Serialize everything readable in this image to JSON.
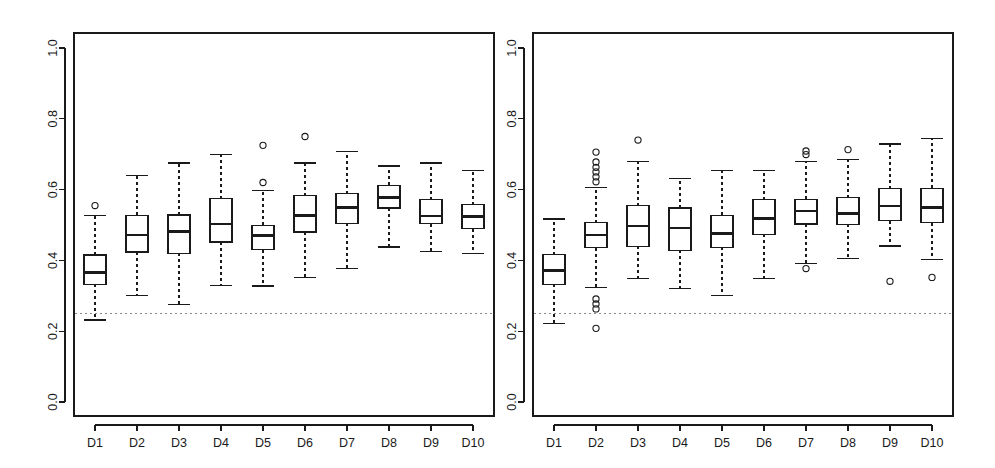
{
  "figure": {
    "width": 995,
    "height": 468,
    "background": "#ffffff",
    "panel_count": 2,
    "line_color": "#1a1a1a",
    "ref_line_color": "#8a8a8a"
  },
  "chart_data": [
    {
      "type": "box",
      "panel": "left",
      "title": "",
      "xlabel": "",
      "ylabel": "",
      "categories": [
        "D1",
        "D2",
        "D3",
        "D4",
        "D5",
        "D6",
        "D7",
        "D8",
        "D9",
        "D10"
      ],
      "ylim": [
        0.0,
        1.04
      ],
      "yticks": [
        0.0,
        0.2,
        0.4,
        0.6,
        0.8,
        1.0
      ],
      "ytick_labels": [
        "0.0",
        "0.2",
        "0.4",
        "0.6",
        "0.8",
        "1.0"
      ],
      "grid": false,
      "legend": "none",
      "reference_line": {
        "y": 0.25,
        "style": "dashed",
        "color": "#8a8a8a"
      },
      "boxes": [
        {
          "label": "D1",
          "lower_whisker": 0.232,
          "q1": 0.332,
          "median": 0.366,
          "q3": 0.415,
          "upper_whisker": 0.527,
          "outliers": [
            0.555
          ]
        },
        {
          "label": "D2",
          "lower_whisker": 0.301,
          "q1": 0.424,
          "median": 0.471,
          "q3": 0.527,
          "upper_whisker": 0.64,
          "outliers": []
        },
        {
          "label": "D3",
          "lower_whisker": 0.276,
          "q1": 0.42,
          "median": 0.482,
          "q3": 0.528,
          "upper_whisker": 0.675,
          "outliers": []
        },
        {
          "label": "D4",
          "lower_whisker": 0.33,
          "q1": 0.452,
          "median": 0.503,
          "q3": 0.574,
          "upper_whisker": 0.7,
          "outliers": []
        },
        {
          "label": "D5",
          "lower_whisker": 0.328,
          "q1": 0.43,
          "median": 0.47,
          "q3": 0.499,
          "upper_whisker": 0.597,
          "outliers": [
            0.725,
            0.62
          ]
        },
        {
          "label": "D6",
          "lower_whisker": 0.352,
          "q1": 0.48,
          "median": 0.527,
          "q3": 0.583,
          "upper_whisker": 0.675,
          "outliers": [
            0.75
          ]
        },
        {
          "label": "D7",
          "lower_whisker": 0.378,
          "q1": 0.505,
          "median": 0.549,
          "q3": 0.588,
          "upper_whisker": 0.707,
          "outliers": []
        },
        {
          "label": "D8",
          "lower_whisker": 0.438,
          "q1": 0.548,
          "median": 0.578,
          "q3": 0.612,
          "upper_whisker": 0.667,
          "outliers": []
        },
        {
          "label": "D9",
          "lower_whisker": 0.425,
          "q1": 0.504,
          "median": 0.526,
          "q3": 0.572,
          "upper_whisker": 0.675,
          "outliers": []
        },
        {
          "label": "D10",
          "lower_whisker": 0.42,
          "q1": 0.49,
          "median": 0.524,
          "q3": 0.557,
          "upper_whisker": 0.653,
          "outliers": []
        }
      ]
    },
    {
      "type": "box",
      "panel": "right",
      "title": "",
      "xlabel": "",
      "ylabel": "",
      "categories": [
        "D1",
        "D2",
        "D3",
        "D4",
        "D5",
        "D6",
        "D7",
        "D8",
        "D9",
        "D10"
      ],
      "ylim": [
        0.0,
        1.04
      ],
      "yticks": [
        0.0,
        0.2,
        0.4,
        0.6,
        0.8,
        1.0
      ],
      "ytick_labels": [
        "0.0",
        "0.2",
        "0.4",
        "0.6",
        "0.8",
        "1.0"
      ],
      "grid": false,
      "legend": "none",
      "reference_line": {
        "y": 0.25,
        "style": "dashed",
        "color": "#8a8a8a"
      },
      "boxes": [
        {
          "label": "D1",
          "lower_whisker": 0.222,
          "q1": 0.333,
          "median": 0.372,
          "q3": 0.416,
          "upper_whisker": 0.517,
          "outliers": []
        },
        {
          "label": "D2",
          "lower_whisker": 0.324,
          "q1": 0.436,
          "median": 0.471,
          "q3": 0.506,
          "upper_whisker": 0.606,
          "outliers": [
            0.706,
            0.678,
            0.663,
            0.65,
            0.636,
            0.622,
            0.291,
            0.277,
            0.263,
            0.208
          ]
        },
        {
          "label": "D3",
          "lower_whisker": 0.348,
          "q1": 0.44,
          "median": 0.498,
          "q3": 0.554,
          "upper_whisker": 0.679,
          "outliers": [
            0.74
          ]
        },
        {
          "label": "D4",
          "lower_whisker": 0.321,
          "q1": 0.428,
          "median": 0.491,
          "q3": 0.548,
          "upper_whisker": 0.632,
          "outliers": []
        },
        {
          "label": "D5",
          "lower_whisker": 0.301,
          "q1": 0.437,
          "median": 0.476,
          "q3": 0.527,
          "upper_whisker": 0.654,
          "outliers": []
        },
        {
          "label": "D6",
          "lower_whisker": 0.349,
          "q1": 0.474,
          "median": 0.518,
          "q3": 0.571,
          "upper_whisker": 0.654,
          "outliers": []
        },
        {
          "label": "D7",
          "lower_whisker": 0.392,
          "q1": 0.503,
          "median": 0.539,
          "q3": 0.573,
          "upper_whisker": 0.679,
          "outliers": [
            0.709,
            0.699,
            0.377
          ]
        },
        {
          "label": "D8",
          "lower_whisker": 0.406,
          "q1": 0.502,
          "median": 0.533,
          "q3": 0.577,
          "upper_whisker": 0.686,
          "outliers": [
            0.713
          ]
        },
        {
          "label": "D9",
          "lower_whisker": 0.441,
          "q1": 0.512,
          "median": 0.554,
          "q3": 0.602,
          "upper_whisker": 0.729,
          "outliers": [
            0.341
          ]
        },
        {
          "label": "D10",
          "lower_whisker": 0.403,
          "q1": 0.506,
          "median": 0.549,
          "q3": 0.604,
          "upper_whisker": 0.745,
          "outliers": [
            0.352
          ]
        }
      ]
    }
  ]
}
